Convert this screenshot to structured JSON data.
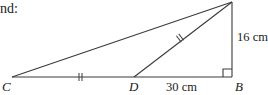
{
  "caption": {
    "text": "nd:"
  },
  "figure": {
    "type": "right-triangle",
    "points": {
      "A": {
        "label": "",
        "x": 232,
        "y": 2
      },
      "B": {
        "label": "B",
        "x": 232,
        "y": 77
      },
      "C": {
        "label": "C",
        "x": 12,
        "y": 77
      },
      "D": {
        "label": "D",
        "x": 134,
        "y": 77
      }
    },
    "segments": [
      {
        "from": "C",
        "to": "A"
      },
      {
        "from": "D",
        "to": "A"
      },
      {
        "from": "C",
        "to": "B"
      },
      {
        "from": "A",
        "to": "B"
      }
    ],
    "right_angle_at": "B",
    "equal_marks": [
      {
        "segment": "CD",
        "marks": 2
      },
      {
        "segment": "DA",
        "marks": 2
      }
    ],
    "measurements": {
      "DB": "30 cm",
      "AB": "16 cm"
    }
  },
  "labels": {
    "C": "C",
    "D": "D",
    "B": "B",
    "db_length": "30 cm",
    "ab_length": "16 cm"
  }
}
